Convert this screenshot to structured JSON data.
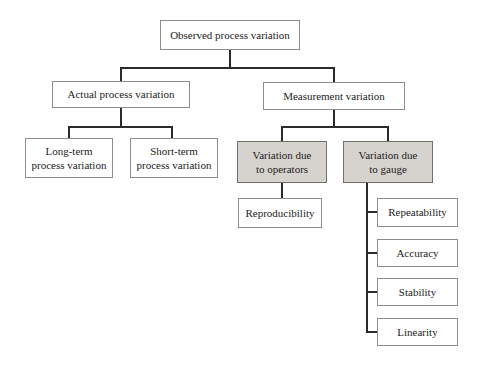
{
  "colors": {
    "background": "#ffffff",
    "node_fill": "#ffffff",
    "shaded_node_fill": "#d6d3ce",
    "node_border": "#8c8c8c",
    "shaded_node_border": "#6f6f6f",
    "connector": "#2b2b2b",
    "text": "#1c1c1c"
  },
  "diagram": {
    "nodes": {
      "observed": {
        "label": "Observed process variation",
        "shaded": false
      },
      "actual": {
        "label": "Actual process variation",
        "shaded": false
      },
      "measurement": {
        "label": "Measurement variation",
        "shaded": false
      },
      "long_term": {
        "label": "Long-term\nprocess variation",
        "shaded": false
      },
      "short_term": {
        "label": "Short-term\nprocess variation",
        "shaded": false
      },
      "operators": {
        "label": "Variation due\nto operators",
        "shaded": true
      },
      "gauge": {
        "label": "Variation due\nto gauge",
        "shaded": true
      },
      "reproducibility": {
        "label": "Reproducibility",
        "shaded": false
      },
      "repeatability": {
        "label": "Repeatability",
        "shaded": false
      },
      "accuracy": {
        "label": "Accuracy",
        "shaded": false
      },
      "stability": {
        "label": "Stability",
        "shaded": false
      },
      "linearity": {
        "label": "Linearity",
        "shaded": false
      }
    },
    "edges": [
      [
        "observed",
        "actual"
      ],
      [
        "observed",
        "measurement"
      ],
      [
        "actual",
        "long_term"
      ],
      [
        "actual",
        "short_term"
      ],
      [
        "measurement",
        "operators"
      ],
      [
        "measurement",
        "gauge"
      ],
      [
        "operators",
        "reproducibility"
      ],
      [
        "gauge",
        "repeatability"
      ],
      [
        "gauge",
        "accuracy"
      ],
      [
        "gauge",
        "stability"
      ],
      [
        "gauge",
        "linearity"
      ]
    ]
  }
}
